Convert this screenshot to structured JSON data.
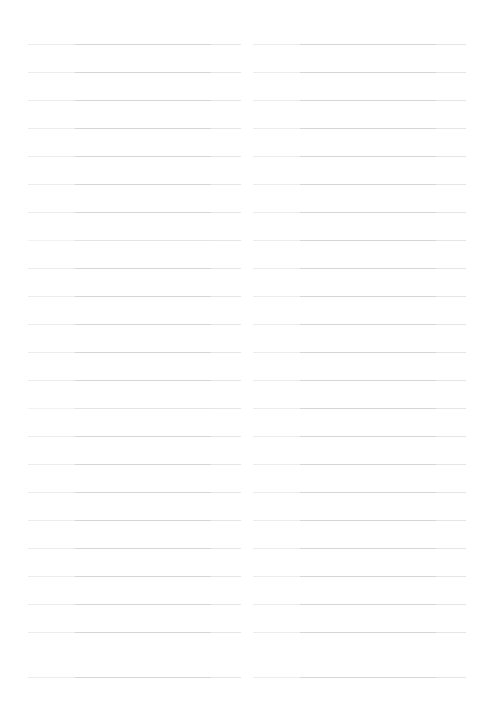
{
  "page": {
    "kind": "scanned-ruled-notebook-page",
    "background_color": "#ffffff",
    "width": 484,
    "height": 708,
    "text_content": "",
    "has_visible_text": false
  },
  "ruling": {
    "line_color": "#d6d6d8",
    "line_color_faded": "#e4e4e6",
    "line_thickness_px": 1,
    "line_spacing_px": 28,
    "first_line_y": 44,
    "last_line_y": 677,
    "line_count_per_column": 23,
    "column_count": 2
  },
  "columns": [
    {
      "name": "left-column",
      "left_x": 28,
      "width": 213,
      "line_count": 23,
      "lines": [
        {
          "y": 44,
          "faded": false
        },
        {
          "y": 72,
          "faded": false
        },
        {
          "y": 100,
          "faded": false
        },
        {
          "y": 128,
          "faded": false
        },
        {
          "y": 156,
          "faded": false
        },
        {
          "y": 184,
          "faded": false
        },
        {
          "y": 212,
          "faded": false
        },
        {
          "y": 240,
          "faded": true
        },
        {
          "y": 268,
          "faded": false
        },
        {
          "y": 296,
          "faded": false
        },
        {
          "y": 324,
          "faded": false
        },
        {
          "y": 352,
          "faded": false
        },
        {
          "y": 380,
          "faded": false
        },
        {
          "y": 408,
          "faded": true
        },
        {
          "y": 436,
          "faded": false
        },
        {
          "y": 464,
          "faded": false
        },
        {
          "y": 492,
          "faded": false
        },
        {
          "y": 520,
          "faded": false
        },
        {
          "y": 548,
          "faded": false
        },
        {
          "y": 576,
          "faded": false
        },
        {
          "y": 604,
          "faded": false
        },
        {
          "y": 632,
          "faded": false
        },
        {
          "y": 677,
          "faded": false
        }
      ]
    },
    {
      "name": "right-column",
      "left_x": 253,
      "width": 213,
      "line_count": 23,
      "lines": [
        {
          "y": 44,
          "faded": false
        },
        {
          "y": 72,
          "faded": false
        },
        {
          "y": 100,
          "faded": false
        },
        {
          "y": 128,
          "faded": false
        },
        {
          "y": 156,
          "faded": false
        },
        {
          "y": 184,
          "faded": false
        },
        {
          "y": 212,
          "faded": false
        },
        {
          "y": 240,
          "faded": false
        },
        {
          "y": 268,
          "faded": false
        },
        {
          "y": 296,
          "faded": false
        },
        {
          "y": 324,
          "faded": false
        },
        {
          "y": 352,
          "faded": false
        },
        {
          "y": 380,
          "faded": false
        },
        {
          "y": 408,
          "faded": false
        },
        {
          "y": 436,
          "faded": false
        },
        {
          "y": 464,
          "faded": false
        },
        {
          "y": 492,
          "faded": false
        },
        {
          "y": 520,
          "faded": false
        },
        {
          "y": 548,
          "faded": false
        },
        {
          "y": 576,
          "faded": false
        },
        {
          "y": 604,
          "faded": false
        },
        {
          "y": 632,
          "faded": false
        },
        {
          "y": 677,
          "faded": false
        }
      ]
    }
  ]
}
